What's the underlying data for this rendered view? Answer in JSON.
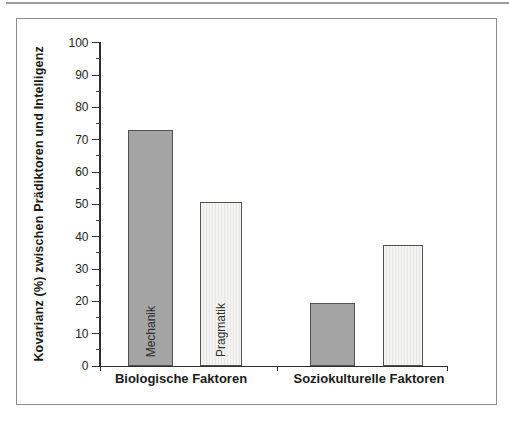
{
  "figure": {
    "background": "#ffffff",
    "frame_border_color": "#8d8d8d"
  },
  "chart_data": {
    "type": "bar",
    "title": "",
    "ylabel": "Kovarianz (%) zwischen Prädiktoren und Intelligenz",
    "xlabel": "",
    "ylim": [
      0,
      100
    ],
    "ytick_interval": 10,
    "ytick_minor_interval": 5,
    "yticks": [
      0,
      10,
      20,
      30,
      40,
      50,
      60,
      70,
      80,
      90,
      100
    ],
    "grid": false,
    "legend": false,
    "categories": [
      "Biologische Faktoren",
      "Soziokulturelle Faktoren"
    ],
    "series": [
      {
        "name": "Mechanik",
        "style": "dark",
        "values": [
          73,
          19.5
        ]
      },
      {
        "name": "Pragmatik",
        "style": "light",
        "values": [
          51,
          37.5
        ]
      }
    ],
    "bars": [
      {
        "category": "Biologische Faktoren",
        "series": "Mechanik",
        "value": 73,
        "style": "dark",
        "inner_label": "Mechanik"
      },
      {
        "category": "Biologische Faktoren",
        "series": "Pragmatik",
        "value": 51,
        "style": "light",
        "inner_label": "Pragmatik"
      },
      {
        "category": "Soziokulturelle Faktoren",
        "series": "Mechanik",
        "value": 19.5,
        "style": "dark",
        "inner_label": ""
      },
      {
        "category": "Soziokulturelle Faktoren",
        "series": "Pragmatik",
        "value": 37.5,
        "style": "light",
        "inner_label": ""
      }
    ],
    "colors": {
      "bar_dark": "#a4a4a4",
      "bar_light": "#f0f0ee",
      "bar_border": "#525252",
      "axis": "#2e2e2e",
      "text": "#1a1a1a"
    }
  }
}
